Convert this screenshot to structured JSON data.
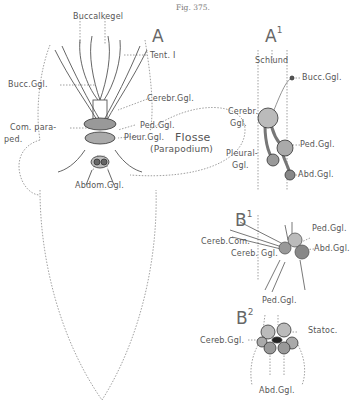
{
  "figure": {
    "number": "Fig. 375."
  },
  "panels": {
    "A": {
      "letter": "A",
      "labels": {
        "buccalkegel": "Buccalkegel",
        "tent": "Tent. I",
        "bucc_ggl": "Bucc.Ggl.",
        "cerebr_ggl": "Cerebr.Ggl.",
        "com_para_1": "Com. para-",
        "com_para_2": "ped.",
        "ped_ggl": "Ped.Ggl.",
        "pleur_ggl": "Pleur.Ggl.",
        "flosse": "Flosse",
        "parapodium": "(Parapodium)",
        "abdom_ggl": "Abdom.Ggl."
      }
    },
    "A1": {
      "letter": "A",
      "sup": "1",
      "labels": {
        "schlund": "Schlund",
        "bucc_ggl": "Bucc.Ggl.",
        "cereb_1": "Cerebr.",
        "cereb_2": "Ggl.",
        "ped_ggl": "Ped.Ggl.",
        "pleural_1": "Pleural-",
        "pleural_2": "Ggl.",
        "abd_ggl": "Abd.Ggl."
      }
    },
    "B1": {
      "letter": "B",
      "sup": "1",
      "labels": {
        "ped_ggl": "Ped.Ggl.",
        "cereb_com": "Cereb.Com.",
        "abd_ggl": "Abd.Ggl.",
        "cereb_ggl": "Cereb. Ggl."
      }
    },
    "B2": {
      "letter": "B",
      "sup": "2",
      "labels": {
        "ped_ggl": "Ped.Ggl.",
        "statoc": "Statoc.",
        "cereb_ggl": "Cereb.Ggl.",
        "abd_ggl": "Abd.Ggl."
      }
    }
  }
}
